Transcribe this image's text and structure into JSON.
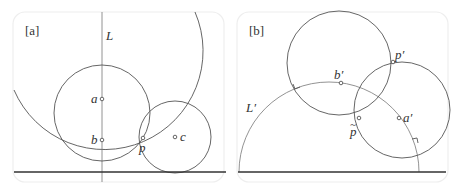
{
  "panels": [
    {
      "tag": "[a]",
      "labels": {
        "line": "L",
        "point_a": "a",
        "point_b": "b",
        "point_c": "c",
        "point_p": "p"
      }
    },
    {
      "tag": "[b]",
      "labels": {
        "line": "L′",
        "point_a": "a′",
        "point_b": "b′",
        "point_p_prime": "p′",
        "point_p_tilde": "p",
        "tilde": "~"
      }
    }
  ],
  "colors": {
    "stroke": "#555555",
    "base_line": "#333333",
    "frame": "#eeeeee"
  }
}
